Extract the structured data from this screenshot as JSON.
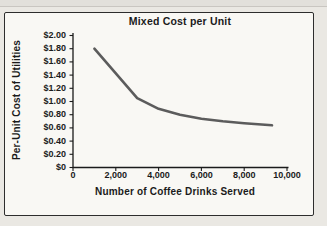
{
  "page": {
    "background": "#eae8e3",
    "top_band_color": "#e2e0db"
  },
  "card": {
    "background": "#f9f8f4",
    "border_color": "#2d2d2d"
  },
  "chart_data": {
    "type": "line",
    "title": "Mixed Cost per Unit",
    "xlabel": "Number of Coffee Drinks Served",
    "ylabel": "Per-Unit Cost of Utilities",
    "xlim": [
      0,
      10000
    ],
    "ylim": [
      0,
      2.0
    ],
    "grid": false,
    "legend": "none",
    "axis_color": "#1b1b1b",
    "line_color": "#5c5c5c",
    "x_ticks": {
      "values": [
        0,
        2000,
        4000,
        6000,
        8000,
        10000
      ],
      "labels": [
        "0",
        "2,000",
        "4,000",
        "6,000",
        "8,000",
        "10,000"
      ]
    },
    "y_ticks": {
      "values": [
        0,
        0.2,
        0.4,
        0.6,
        0.8,
        1.0,
        1.2,
        1.4,
        1.6,
        1.8,
        2.0
      ],
      "labels": [
        "$0",
        "$0.20",
        "$0.40",
        "$0.60",
        "$0.80",
        "$1.00",
        "$1.20",
        "$1.40",
        "$1.60",
        "$1.80",
        "$2.00"
      ]
    },
    "series": [
      {
        "name": "Per-unit utilities cost",
        "points": [
          [
            1000,
            1.8
          ],
          [
            3000,
            1.05
          ],
          [
            4000,
            0.89
          ],
          [
            5000,
            0.8
          ],
          [
            6000,
            0.74
          ],
          [
            7000,
            0.7
          ],
          [
            8000,
            0.67
          ],
          [
            9300,
            0.64
          ]
        ]
      }
    ]
  }
}
